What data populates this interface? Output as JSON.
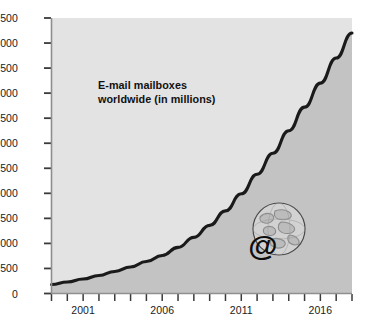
{
  "chart_data": {
    "type": "area",
    "title": "E-mail mailboxes worldwide (in millions)",
    "xlabel": "",
    "ylabel": "",
    "ylim": [
      0,
      5500
    ],
    "xlim": [
      1999,
      2018
    ],
    "grid": false,
    "legend": "none",
    "annotation": {
      "line1": "E-mail mailboxes",
      "line2": "worldwide (in millions)"
    },
    "ytick_labels": [
      "0",
      "500",
      "1,000",
      "1,500",
      "2,000",
      "2,500",
      "3,000",
      "3,500",
      "4,000",
      "4,500",
      "5,000",
      "5,500"
    ],
    "ytick_values": [
      0,
      500,
      1000,
      1500,
      2000,
      2500,
      3000,
      3500,
      4000,
      4500,
      5000,
      5500
    ],
    "xtick_labels": [
      "2001",
      "2006",
      "2011",
      "2016"
    ],
    "xtick_values": [
      2001,
      2006,
      2011,
      2016
    ],
    "x": [
      1999,
      2000,
      2001,
      2002,
      2003,
      2004,
      2005,
      2006,
      2007,
      2008,
      2009,
      2010,
      2011,
      2012,
      2013,
      2014,
      2015,
      2016,
      2017,
      2018
    ],
    "values": [
      180,
      230,
      290,
      360,
      440,
      530,
      640,
      760,
      920,
      1120,
      1360,
      1650,
      1990,
      2380,
      2800,
      3250,
      3720,
      4200,
      4700,
      5200
    ],
    "series": [
      {
        "name": "E-mail mailboxes worldwide",
        "values": [
          180,
          230,
          290,
          360,
          440,
          530,
          640,
          760,
          920,
          1120,
          1360,
          1650,
          1990,
          2380,
          2800,
          3250,
          3720,
          4200,
          4700,
          5200
        ]
      }
    ],
    "colors": {
      "line": "#1a1a1a",
      "area_below": "#c2c2c2",
      "area_above": "#e2e2e2",
      "text": "#1a1a1a",
      "page_background": "#ffffff"
    }
  },
  "icons": {
    "globe_at": "globe-at-email-icon"
  }
}
